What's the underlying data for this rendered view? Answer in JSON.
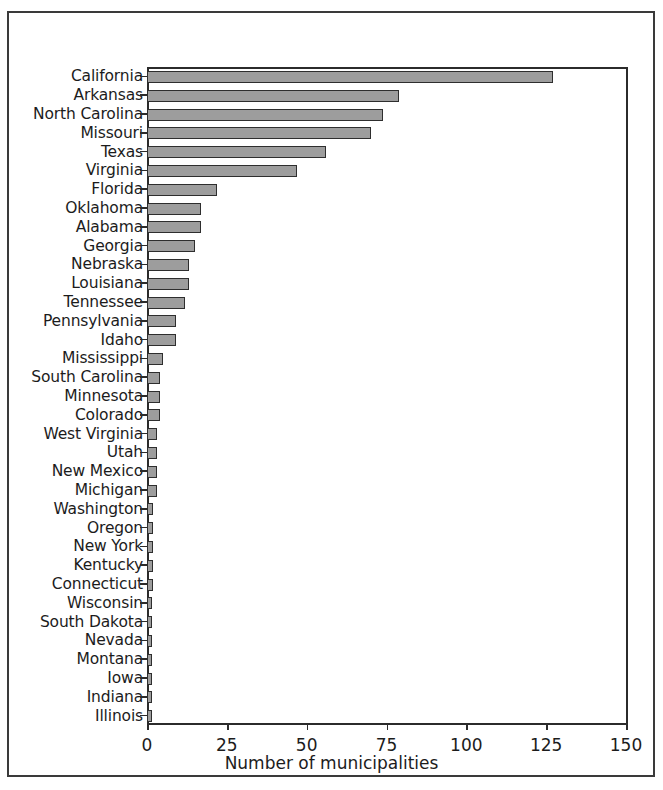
{
  "figure": {
    "background_color": "#ffffff",
    "frame_color": "#3a3a3a",
    "axis_color": "#2b2b2b",
    "bar_fill_color": "#9d9d9d",
    "bar_edge_color": "#2e2e2e"
  },
  "chart_data": {
    "type": "bar",
    "orientation": "horizontal",
    "title": "",
    "xlabel": "Number of municipalities",
    "ylabel": "",
    "xlim": [
      0,
      150
    ],
    "ylim": null,
    "grid": false,
    "legend": null,
    "xticks": [
      0,
      25,
      50,
      75,
      100,
      125,
      150
    ],
    "xticklabels": [
      "0",
      "25",
      "50",
      "75",
      "100",
      "125",
      "150"
    ],
    "categories": [
      "California",
      "Arkansas",
      "North Carolina",
      "Missouri",
      "Texas",
      "Virginia",
      "Florida",
      "Oklahoma",
      "Alabama",
      "Georgia",
      "Nebraska",
      "Louisiana",
      "Tennessee",
      "Pennsylvania",
      "Idaho",
      "Mississippi",
      "South Carolina",
      "Minnesota",
      "Colorado",
      "West Virginia",
      "Utah",
      "New Mexico",
      "Michigan",
      "Washington",
      "Oregon",
      "New York",
      "Kentucky",
      "Connecticut",
      "Wisconsin",
      "South Dakota",
      "Nevada",
      "Montana",
      "Iowa",
      "Indiana",
      "Illinois"
    ],
    "values": [
      127,
      79,
      74,
      70,
      56,
      47,
      22,
      17,
      17,
      15,
      13,
      13,
      12,
      9,
      9,
      5,
      4,
      4,
      4,
      3,
      3,
      3,
      3,
      2,
      2,
      2,
      2,
      2,
      1,
      1,
      1,
      1,
      1,
      1,
      1
    ]
  }
}
